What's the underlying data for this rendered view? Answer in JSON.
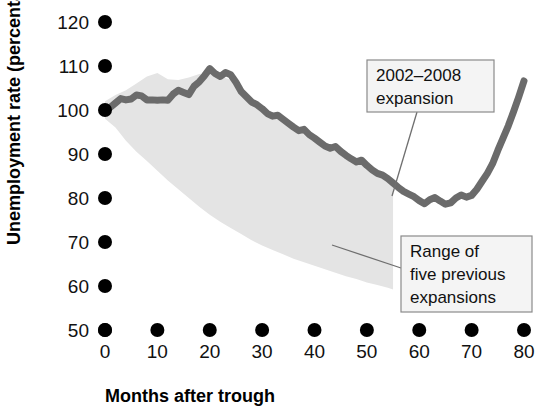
{
  "chart_data": {
    "type": "line",
    "title": "",
    "xlabel": "Months after trough",
    "ylabel": "Unemployment rate (percentage of trough)",
    "xlim": [
      0,
      80
    ],
    "ylim": [
      50,
      120
    ],
    "xticks": [
      0,
      10,
      20,
      30,
      40,
      50,
      60,
      70,
      80
    ],
    "yticks": [
      50,
      60,
      70,
      80,
      90,
      100,
      110,
      120
    ],
    "grid": false,
    "legend_position": "annotations-inline",
    "colors": {
      "line": "#6b6b6b",
      "band": "#e4e4e4",
      "callout_fill": "#f4f4f4",
      "callout_border": "#8a8a8a",
      "text": "#111111"
    },
    "series": [
      {
        "name": "2002-2008 expansion",
        "type": "line",
        "x": [
          0,
          1,
          2,
          3,
          4,
          5,
          6,
          7,
          8,
          9,
          10,
          11,
          12,
          13,
          14,
          15,
          16,
          17,
          18,
          19,
          20,
          21,
          22,
          23,
          24,
          25,
          26,
          27,
          28,
          29,
          30,
          31,
          32,
          33,
          34,
          35,
          36,
          37,
          38,
          39,
          40,
          41,
          42,
          43,
          44,
          45,
          46,
          47,
          48,
          49,
          50,
          51,
          52,
          53,
          54,
          55,
          56,
          57,
          58,
          59,
          60,
          61,
          62,
          63,
          64,
          65,
          66,
          67,
          68,
          69,
          70,
          71,
          72,
          73,
          74,
          75,
          76,
          77,
          78,
          79,
          80
        ],
        "values": [
          100.0,
          100.6,
          101.6,
          102.6,
          102.3,
          102.5,
          103.4,
          103.2,
          102.3,
          102.3,
          102.2,
          102.3,
          102.2,
          103.6,
          104.5,
          104.0,
          103.5,
          105.4,
          106.4,
          107.8,
          109.4,
          108.3,
          107.6,
          108.5,
          108.0,
          106.3,
          104.2,
          103.0,
          101.8,
          101.2,
          100.3,
          99.2,
          98.6,
          98.8,
          97.9,
          97.0,
          96.1,
          95.3,
          95.6,
          94.4,
          93.6,
          92.7,
          91.8,
          91.3,
          91.7,
          90.6,
          89.7,
          88.9,
          88.2,
          88.6,
          87.4,
          86.4,
          85.6,
          85.2,
          84.4,
          83.4,
          82.4,
          81.5,
          80.9,
          80.3,
          79.4,
          78.7,
          79.6,
          80.1,
          79.3,
          78.6,
          78.9,
          80.0,
          80.7,
          80.2,
          80.6,
          82.0,
          83.8,
          85.6,
          87.8,
          90.8,
          93.6,
          96.4,
          99.6,
          103.0,
          106.6
        ]
      },
      {
        "name": "Range of five previous expansions",
        "type": "band",
        "x": [
          0,
          2,
          4,
          6,
          8,
          10,
          12,
          14,
          16,
          18,
          20,
          22,
          24,
          26,
          28,
          30,
          32,
          34,
          36,
          38,
          40,
          42,
          44,
          46,
          48,
          50,
          52,
          54,
          55
        ],
        "upper": [
          102.0,
          103.4,
          104.5,
          106.0,
          107.6,
          108.4,
          107.0,
          106.8,
          107.4,
          108.2,
          108.6,
          107.8,
          106.8,
          104.4,
          102.0,
          100.2,
          98.6,
          97.2,
          96.0,
          95.0,
          93.8,
          92.4,
          91.4,
          90.3,
          89.2,
          87.8,
          86.4,
          85.0,
          84.4
        ],
        "lower": [
          98.0,
          96.0,
          93.0,
          90.5,
          88.4,
          86.2,
          84.0,
          82.0,
          80.0,
          78.0,
          76.2,
          74.6,
          73.2,
          71.8,
          70.4,
          69.2,
          68.2,
          67.2,
          66.2,
          65.4,
          64.6,
          63.8,
          63.0,
          62.2,
          61.6,
          60.8,
          60.2,
          59.6,
          59.2
        ]
      }
    ],
    "annotations": [
      {
        "id": "expansion-callout",
        "lines": [
          "2002–2008",
          "expansion"
        ],
        "box": {
          "x": 367,
          "y": 60,
          "width": 127,
          "height": 52
        },
        "leader_from": {
          "x": 417,
          "y": 112
        },
        "leader_to": {
          "x": 392,
          "y": 196
        }
      },
      {
        "id": "range-callout",
        "lines": [
          "Range of",
          "five previous",
          "expansions"
        ],
        "box": {
          "x": 401,
          "y": 236,
          "width": 131,
          "height": 76
        },
        "leader_from": {
          "x": 401,
          "y": 268
        },
        "leader_to": {
          "x": 332,
          "y": 245
        }
      }
    ]
  }
}
